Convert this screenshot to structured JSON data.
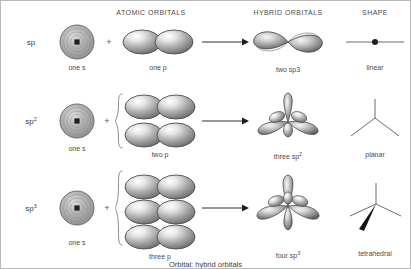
{
  "figure": {
    "caption": "Orbital: hybrid orbitals",
    "headers": [
      {
        "label": "ATOMIC ORBITALS",
        "x": 150,
        "y": 8
      },
      {
        "label": "HYBRID ORBITALS",
        "x": 287,
        "y": 8
      },
      {
        "label": "SHAPE",
        "x": 374,
        "y": 8
      }
    ],
    "columns": {
      "hybridization": "Hybridization",
      "atomic_orbitals": "ATOMIC ORBITALS",
      "hybrid_orbitals": "HYBRID ORBITALS",
      "shape": "SHAPE"
    },
    "rows": [
      {
        "name": "sp",
        "hybridization_base": "sp",
        "hybridization_sup": "",
        "s_label": "one s",
        "p_label": "one p",
        "p_count": 1,
        "operator": "+",
        "hybrid_label_base": "two sp3",
        "hybrid_label_sup": "",
        "shape_label": "linear"
      },
      {
        "name": "sp2",
        "hybridization_base": "sp",
        "hybridization_sup": "2",
        "s_label": "one s",
        "p_label": "two p",
        "p_count": 2,
        "operator": "+",
        "hybrid_label_base": "three sp",
        "hybrid_label_sup": "2",
        "shape_label": "planar"
      },
      {
        "name": "sp3",
        "hybridization_base": "sp",
        "hybridization_sup": "3",
        "s_label": "one s",
        "p_label": "three p",
        "p_count": 3,
        "operator": "+",
        "hybrid_label_base": "four sp",
        "hybrid_label_sup": "3",
        "shape_label": "tetrahedral"
      }
    ],
    "colors": {
      "text": "#3d3d3d",
      "header_text": "#4a4a4a",
      "orbital_light": "#f2f2f2",
      "orbital_mid": "#9a9a9a",
      "orbital_dark": "#5a5a5a",
      "outline": "#4d4d4d",
      "border": "#b9b9b9",
      "background": "#ffffff"
    }
  }
}
